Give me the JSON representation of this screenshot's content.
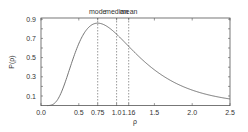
{
  "chart_data": {
    "type": "line",
    "title": "",
    "xlabel": "ρ",
    "ylabel": "P(ρ)",
    "xlim": [
      0,
      2.5
    ],
    "ylim": [
      0,
      0.9
    ],
    "x_ticks": [
      "0.0",
      "0.5",
      "0.75",
      "1.0",
      "1.16",
      "1.5",
      "2.0",
      "2.5"
    ],
    "x_tick_values": [
      0,
      0.5,
      0.75,
      1.0,
      1.16,
      1.5,
      2.0,
      2.5
    ],
    "y_ticks": [
      "0.1",
      "0.3",
      "0.5",
      "0.7",
      "0.9"
    ],
    "y_tick_values": [
      0.1,
      0.3,
      0.5,
      0.7,
      0.9
    ],
    "grid": false,
    "series": [
      {
        "name": "P(ρ)",
        "x": [
          0.1,
          0.2,
          0.3,
          0.4,
          0.5,
          0.6,
          0.75,
          0.9,
          1.0,
          1.16,
          1.3,
          1.5,
          1.75,
          2.0,
          2.25,
          2.5
        ],
        "values": [
          0.01,
          0.12,
          0.34,
          0.56,
          0.72,
          0.82,
          0.86,
          0.81,
          0.75,
          0.63,
          0.52,
          0.4,
          0.27,
          0.18,
          0.12,
          0.08
        ]
      }
    ],
    "annotations": [
      {
        "label": "mode",
        "x": 0.75
      },
      {
        "label": "median",
        "x": 1.0
      },
      {
        "label": "mean",
        "x": 1.16
      }
    ]
  }
}
